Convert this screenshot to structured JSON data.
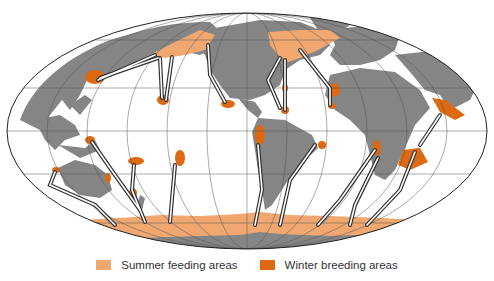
{
  "map": {
    "title": "Humpback whale migration routes",
    "projection": "Mollweide world map",
    "colors": {
      "ocean": "#ffffff",
      "land": "#858585",
      "summer_feeding": "#f0a870",
      "winter_breeding": "#dd6a12",
      "route_outline": "#333333",
      "graticule": "#555555"
    }
  },
  "legend": {
    "items": [
      {
        "label": "Summer feeding areas",
        "color": "#f0a870"
      },
      {
        "label": "Winter breeding areas",
        "color": "#dd6a12"
      }
    ]
  }
}
